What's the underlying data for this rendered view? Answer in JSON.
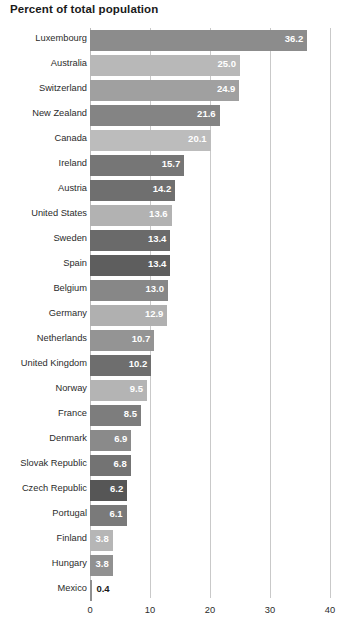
{
  "chart_data": {
    "type": "bar",
    "orientation": "horizontal",
    "title": "Percent of total population",
    "xlabel": "",
    "ylabel": "",
    "xlim": [
      0,
      40
    ],
    "xticks": [
      "0",
      "10",
      "20",
      "30",
      "40"
    ],
    "grid": true,
    "legend": "none",
    "categories": [
      "Luxembourg",
      "Australia",
      "Switzerland",
      "New Zealand",
      "Canada",
      "Ireland",
      "Austria",
      "United States",
      "Sweden",
      "Spain",
      "Belgium",
      "Germany",
      "Netherlands",
      "United Kingdom",
      "Norway",
      "France",
      "Denmark",
      "Slovak Republic",
      "Czech Republic",
      "Portugal",
      "Finland",
      "Hungary",
      "Mexico"
    ],
    "values": [
      36.2,
      25.0,
      24.9,
      21.6,
      20.1,
      15.7,
      14.2,
      13.6,
      13.4,
      13.4,
      13.0,
      12.9,
      10.7,
      10.2,
      9.5,
      8.5,
      6.9,
      6.8,
      6.2,
      6.1,
      3.8,
      3.8,
      0.4
    ],
    "value_labels": [
      "36.2",
      "25.0",
      "24.9",
      "21.6",
      "20.1",
      "15.7",
      "14.2",
      "13.6",
      "13.4",
      "13.4",
      "13.0",
      "12.9",
      "10.7",
      "10.2",
      "9.5",
      "8.5",
      "6.9",
      "6.8",
      "6.2",
      "6.1",
      "3.8",
      "3.8",
      "0.4"
    ],
    "bar_colors": [
      "#8c8c8c",
      "#b8b8b8",
      "#a0a0a0",
      "#848484",
      "#bcbcbc",
      "#767676",
      "#6f6f6f",
      "#b2b2b2",
      "#6a6a6a",
      "#5e5e5e",
      "#878787",
      "#b0b0b0",
      "#949494",
      "#6e6e6e",
      "#b4b4b4",
      "#7d7d7d",
      "#8a8a8a",
      "#737373",
      "#565656",
      "#7a7a7a",
      "#b6b6b6",
      "#919191",
      "#8f8f8f"
    ],
    "label_inside": [
      true,
      true,
      true,
      true,
      true,
      true,
      true,
      true,
      true,
      true,
      true,
      true,
      true,
      true,
      true,
      true,
      true,
      true,
      true,
      true,
      true,
      true,
      false
    ],
    "gridline_color": "#c9c9c9",
    "background_color": "#ffffff",
    "text_color": "#231f20"
  }
}
